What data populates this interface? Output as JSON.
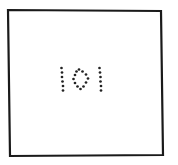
{
  "figure": {
    "text": "101",
    "frame": {
      "corners": [
        [
          8,
          10
        ],
        [
          161,
          11
        ],
        [
          163,
          155
        ],
        [
          10,
          156
        ]
      ],
      "stroke_color": "#1a1a1a",
      "stroke_width": 2.2
    },
    "dot_color": "#222222",
    "dot_radius": 1.35,
    "digits": [
      {
        "label": "1",
        "dots": [
          [
            61.5,
            68
          ],
          [
            62,
            72.5
          ],
          [
            62,
            77
          ],
          [
            62.5,
            81.5
          ],
          [
            63,
            86
          ],
          [
            63,
            90.5
          ]
        ]
      },
      {
        "label": "0",
        "dots": [
          [
            79,
            69.5
          ],
          [
            82.5,
            71.5
          ],
          [
            86,
            74.5
          ],
          [
            88,
            78.5
          ],
          [
            86,
            82.5
          ],
          [
            83.5,
            86.5
          ],
          [
            80.5,
            89
          ],
          [
            77.5,
            86.5
          ],
          [
            75,
            83
          ],
          [
            73.5,
            79
          ],
          [
            75,
            75
          ],
          [
            76.5,
            71.5
          ]
        ]
      },
      {
        "label": "1",
        "dots": [
          [
            99.5,
            68
          ],
          [
            100,
            72.5
          ],
          [
            100.5,
            77
          ],
          [
            100.5,
            81.5
          ],
          [
            101,
            86
          ],
          [
            101,
            90.5
          ]
        ]
      }
    ]
  }
}
